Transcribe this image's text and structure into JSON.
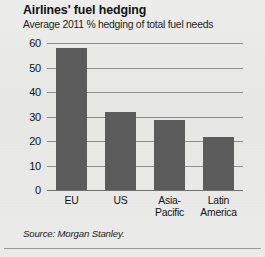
{
  "chart_data": {
    "type": "bar",
    "title": "Airlines' fuel hedging",
    "subtitle": "Average 2011 % hedging of total fuel needs",
    "categories": [
      "EU",
      "US",
      "Asia-Pacific",
      "Latin America"
    ],
    "category_lines": [
      [
        "EU"
      ],
      [
        "US"
      ],
      [
        "Asia-",
        "Pacific"
      ],
      [
        "Latin",
        "America"
      ]
    ],
    "values": [
      58,
      32,
      28.5,
      21.5
    ],
    "xlabel": "",
    "ylabel": "",
    "ylim": [
      0,
      60
    ],
    "yticks": [
      60,
      50,
      40,
      30,
      20,
      10,
      0
    ],
    "ytick_labels": [
      "60",
      "50",
      "40",
      "30",
      "20",
      "10",
      "0"
    ],
    "grid": true,
    "legend": false,
    "series": [
      {
        "name": "Average 2011 % hedging of total fuel needs",
        "values": [
          58,
          32,
          28.5,
          21.5
        ]
      }
    ],
    "bar_color": "#5c5c5c",
    "gridline_color": "#8e8e8e",
    "background_color": "#e9e9e7"
  },
  "source": {
    "text": "Source: Morgan Stanley."
  }
}
